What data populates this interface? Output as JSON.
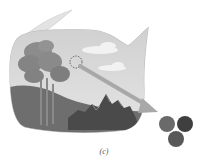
{
  "figure": {
    "caption": "(c)",
    "colors": {
      "bubble_fill": "#d9d9d9",
      "bubble_edge": "#bdbdbd",
      "ground": "#6e6e6e",
      "tree": "#8a8a8a",
      "mountain": "#4a4a4a",
      "arrow": "#a8a8a8",
      "sphere_1": "#6a6a6a",
      "sphere_2": "#3f3f3f",
      "sphere_3": "#585858"
    }
  }
}
